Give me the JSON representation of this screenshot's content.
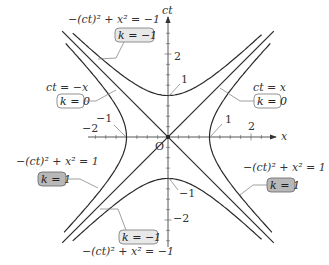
{
  "diagram": {
    "axes": {
      "x_label": "x",
      "y_label": "ct",
      "origin_label": "O",
      "x_ticks": [
        {
          "value": -2,
          "label": "−2"
        },
        {
          "value": -1,
          "label": "−1"
        },
        {
          "value": 1,
          "label": "1"
        },
        {
          "value": 2,
          "label": "2"
        }
      ],
      "y_ticks": [
        {
          "value": 2,
          "label": "2"
        },
        {
          "value": 1,
          "label": "1"
        },
        {
          "value": -1,
          "label": "−1"
        },
        {
          "value": -2,
          "label": "−2"
        }
      ]
    },
    "annotations": {
      "top_left_eq": "−(ct)² + x² = −1",
      "top_left_k": "k = −1",
      "left_line_eq": "ct = −x",
      "left_line_k": "k = 0",
      "right_line_eq": "ct = x",
      "right_line_k": "k = 0",
      "left_eq": "−(ct)² + x² = 1",
      "left_k": "k = 1",
      "right_eq": "−(ct)² + x² = 1",
      "right_k": "k = 1",
      "bottom_k": "k = −1",
      "bottom_eq": "−(ct)² + x² = −1",
      "vertex_top": "1",
      "vertex_bottom": "−1",
      "vertex_right": "1",
      "vertex_left": "−1"
    },
    "colors": {
      "k_minus1_box_fill": "#e8e8e8",
      "k_1_box_fill": "#b8b8b8",
      "k_0_box_fill": "#ffffff",
      "curve": "#2a2a2a"
    }
  }
}
